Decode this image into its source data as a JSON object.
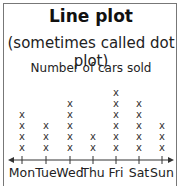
{
  "title": "Line plot",
  "subtitle": "(sometimes called dot plot)",
  "chart_data": {
    "type": "line-plot",
    "title": "Number of cars sold",
    "categories": [
      "Mon",
      "Tue",
      "Wed",
      "Thu",
      "Fri",
      "Sat",
      "Sun"
    ],
    "values": [
      4,
      3,
      5,
      2,
      6,
      5,
      3
    ],
    "marker": "x",
    "xlabel": "",
    "ylabel": "",
    "axis": "number line with arrows at both ends",
    "grid": false
  }
}
